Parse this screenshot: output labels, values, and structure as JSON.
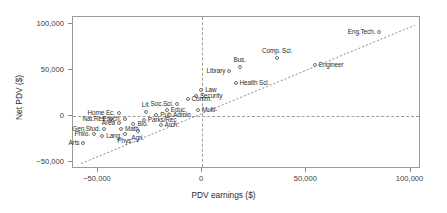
{
  "chart_data": {
    "type": "scatter",
    "title": "",
    "xlabel": "PDV earnings ($)",
    "ylabel": "Net PDV ($)",
    "xlim": [
      -62000,
      105000
    ],
    "ylim": [
      -58000,
      108000
    ],
    "xticks": [
      -50000,
      0,
      50000,
      100000
    ],
    "xticklabels": [
      "−50,000",
      "0",
      "50,000",
      "100,000"
    ],
    "yticks": [
      -50000,
      0,
      50000,
      100000
    ],
    "yticklabels": [
      "−50,000",
      "0",
      "50,000",
      "100,000"
    ],
    "grid": false,
    "legend": null,
    "reference_lines": [
      {
        "axis": "x",
        "value": 0,
        "style": "dashed"
      },
      {
        "axis": "y",
        "value": 0,
        "style": "dashed"
      }
    ],
    "trend_line": {
      "style": "dashed",
      "x": [
        -58000,
        102000
      ],
      "y": [
        -52000,
        99000
      ]
    },
    "points": [
      {
        "label": "Eng.Tech.",
        "x": 85000,
        "y": 92000,
        "label_pos": "left"
      },
      {
        "label": "Engineer",
        "x": 54000,
        "y": 56000,
        "label_pos": "right"
      },
      {
        "label": "Comp. Sci.",
        "x": 36000,
        "y": 63000,
        "label_pos": "top"
      },
      {
        "label": "Bus.",
        "x": 18000,
        "y": 53000,
        "label_pos": "top"
      },
      {
        "label": "Library",
        "x": 13000,
        "y": 49000,
        "label_pos": "left"
      },
      {
        "label": "Health Sci.",
        "x": 16000,
        "y": 36000,
        "label_pos": "right"
      },
      {
        "label": "Law",
        "x": -500,
        "y": 28000,
        "label_pos": "right"
      },
      {
        "label": "Security",
        "x": -3000,
        "y": 22000,
        "label_pos": "right"
      },
      {
        "label": "Comm.",
        "x": -7000,
        "y": 18000,
        "label_pos": "right"
      },
      {
        "label": "Soc.Sci.",
        "x": -12000,
        "y": 13000,
        "label_pos": "left"
      },
      {
        "label": "Educ.",
        "x": -17000,
        "y": 6000,
        "label_pos": "right"
      },
      {
        "label": "Multi-",
        "x": -2000,
        "y": 6000,
        "label_pos": "right"
      },
      {
        "label": "Pub.Admin",
        "x": -22000,
        "y": 1000,
        "label_pos": "right"
      },
      {
        "label": "Lit.",
        "x": -27000,
        "y": 4000,
        "label_pos": "top"
      },
      {
        "label": "Home Ec.",
        "x": -40000,
        "y": 3000,
        "label_pos": "left"
      },
      {
        "label": "Parks/Rec",
        "x": -28000,
        "y": -4000,
        "label_pos": "right"
      },
      {
        "label": "Nat.Res.",
        "x": -44000,
        "y": -3000,
        "label_pos": "left"
      },
      {
        "label": "Psych.",
        "x": -37000,
        "y": -3000,
        "label_pos": "left"
      },
      {
        "label": "Arch.",
        "x": -20000,
        "y": -10000,
        "label_pos": "right"
      },
      {
        "label": "Bio.",
        "x": -33000,
        "y": -9000,
        "label_pos": "right"
      },
      {
        "label": "Area",
        "x": -40000,
        "y": -8000,
        "label_pos": "left"
      },
      {
        "label": "Agri.",
        "x": -31000,
        "y": -16000,
        "label_pos": "bottom"
      },
      {
        "label": "Gen.Stud.",
        "x": -47000,
        "y": -14000,
        "label_pos": "left"
      },
      {
        "label": "Math",
        "x": -39000,
        "y": -14000,
        "label_pos": "right"
      },
      {
        "label": "Phys.",
        "x": -37000,
        "y": -20000,
        "label_pos": "bottom"
      },
      {
        "label": "Philo.",
        "x": -52000,
        "y": -20000,
        "label_pos": "left"
      },
      {
        "label": "Lang.",
        "x": -48000,
        "y": -22000,
        "label_pos": "right"
      },
      {
        "label": "Arts",
        "x": -57000,
        "y": -30000,
        "label_pos": "left"
      }
    ]
  }
}
